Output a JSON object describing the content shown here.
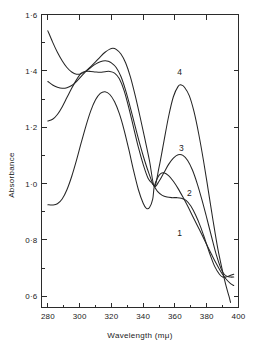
{
  "chart_data": {
    "type": "line",
    "title": "",
    "xlabel": "Wavelength (mμ)",
    "ylabel": "Absorbance",
    "xlim": [
      276,
      400
    ],
    "ylim": [
      0.56,
      1.6
    ],
    "grid": false,
    "legend_position": "inline-curve-labels",
    "xticks": [
      280,
      300,
      320,
      340,
      360,
      380,
      400
    ],
    "xtick_labels": [
      "280",
      "300",
      "320",
      "340",
      "360",
      "380",
      "400"
    ],
    "xminor_ticks": [
      290,
      310,
      330,
      350,
      370,
      390
    ],
    "yticks": [
      0.6,
      0.8,
      1.0,
      1.2,
      1.4,
      1.6
    ],
    "ytick_labels": [
      "0·6",
      "0·8",
      "1·0",
      "1·2",
      "1·4",
      "1·6"
    ],
    "yminor_ticks": [
      0.7,
      0.9,
      1.1,
      1.3,
      1.5
    ],
    "annotations": [
      {
        "text": "1",
        "x": 363,
        "y": 0.815
      },
      {
        "text": "2",
        "x": 369,
        "y": 0.955
      },
      {
        "text": "3",
        "x": 364,
        "y": 1.115
      },
      {
        "text": "4",
        "x": 363,
        "y": 1.385
      }
    ],
    "isosbestic_point": {
      "x": 347,
      "y": 0.99
    },
    "series": [
      {
        "name": "1",
        "label": "1",
        "points": [
          [
            280,
            0.925
          ],
          [
            283,
            0.924
          ],
          [
            286,
            0.928
          ],
          [
            289,
            0.945
          ],
          [
            292,
            0.978
          ],
          [
            295,
            1.025
          ],
          [
            298,
            1.082
          ],
          [
            301,
            1.145
          ],
          [
            304,
            1.205
          ],
          [
            307,
            1.258
          ],
          [
            310,
            1.297
          ],
          [
            313,
            1.32
          ],
          [
            316,
            1.326
          ],
          [
            319,
            1.316
          ],
          [
            322,
            1.29
          ],
          [
            325,
            1.248
          ],
          [
            328,
            1.19
          ],
          [
            331,
            1.12
          ],
          [
            334,
            1.045
          ],
          [
            337,
            0.978
          ],
          [
            340,
            0.93
          ],
          [
            342,
            0.912
          ],
          [
            344,
            0.915
          ],
          [
            346,
            0.945
          ],
          [
            347,
            0.99
          ],
          [
            349,
            1.02
          ],
          [
            351,
            1.035
          ],
          [
            353,
            1.038
          ],
          [
            356,
            1.028
          ],
          [
            359,
            1.008
          ],
          [
            362,
            0.982
          ],
          [
            365,
            0.952
          ],
          [
            368,
            0.92
          ],
          [
            371,
            0.886
          ],
          [
            374,
            0.852
          ],
          [
            377,
            0.818
          ],
          [
            380,
            0.783
          ],
          [
            383,
            0.749
          ],
          [
            386,
            0.716
          ],
          [
            389,
            0.686
          ],
          [
            392,
            0.662
          ],
          [
            395,
            0.645
          ],
          [
            397,
            0.638
          ]
        ]
      },
      {
        "name": "2",
        "label": "2",
        "points": [
          [
            280,
            1.222
          ],
          [
            283,
            1.228
          ],
          [
            286,
            1.245
          ],
          [
            289,
            1.272
          ],
          [
            292,
            1.305
          ],
          [
            295,
            1.338
          ],
          [
            298,
            1.368
          ],
          [
            301,
            1.392
          ],
          [
            304,
            1.398
          ],
          [
            307,
            1.398
          ],
          [
            310,
            1.396
          ],
          [
            313,
            1.395
          ],
          [
            316,
            1.397
          ],
          [
            319,
            1.398
          ],
          [
            322,
            1.392
          ],
          [
            325,
            1.372
          ],
          [
            328,
            1.33
          ],
          [
            331,
            1.268
          ],
          [
            334,
            1.198
          ],
          [
            337,
            1.128
          ],
          [
            340,
            1.068
          ],
          [
            343,
            1.02
          ],
          [
            346,
            0.998
          ],
          [
            347,
            0.99
          ],
          [
            349,
            0.972
          ],
          [
            352,
            0.958
          ],
          [
            355,
            0.952
          ],
          [
            358,
            0.95
          ],
          [
            361,
            0.95
          ],
          [
            364,
            0.948
          ],
          [
            367,
            0.94
          ],
          [
            370,
            0.92
          ],
          [
            373,
            0.888
          ],
          [
            376,
            0.848
          ],
          [
            379,
            0.8
          ],
          [
            382,
            0.75
          ],
          [
            385,
            0.706
          ],
          [
            388,
            0.678
          ],
          [
            390,
            0.668
          ],
          [
            392,
            0.668
          ],
          [
            394,
            0.672
          ],
          [
            396,
            0.676
          ],
          [
            397,
            0.678
          ]
        ]
      },
      {
        "name": "3",
        "label": "3",
        "points": [
          [
            280,
            1.362
          ],
          [
            283,
            1.35
          ],
          [
            286,
            1.342
          ],
          [
            289,
            1.338
          ],
          [
            292,
            1.34
          ],
          [
            295,
            1.348
          ],
          [
            298,
            1.362
          ],
          [
            301,
            1.38
          ],
          [
            304,
            1.398
          ],
          [
            307,
            1.412
          ],
          [
            310,
            1.424
          ],
          [
            313,
            1.432
          ],
          [
            316,
            1.436
          ],
          [
            318,
            1.434
          ],
          [
            320,
            1.428
          ],
          [
            323,
            1.412
          ],
          [
            326,
            1.38
          ],
          [
            329,
            1.33
          ],
          [
            332,
            1.268
          ],
          [
            335,
            1.202
          ],
          [
            338,
            1.138
          ],
          [
            341,
            1.08
          ],
          [
            344,
            1.03
          ],
          [
            347,
            0.99
          ],
          [
            350,
            1.008
          ],
          [
            353,
            1.038
          ],
          [
            356,
            1.068
          ],
          [
            359,
            1.09
          ],
          [
            362,
            1.102
          ],
          [
            365,
            1.1
          ],
          [
            368,
            1.082
          ],
          [
            371,
            1.048
          ],
          [
            374,
            1.0
          ],
          [
            377,
            0.942
          ],
          [
            380,
            0.878
          ],
          [
            383,
            0.812
          ],
          [
            386,
            0.748
          ],
          [
            389,
            0.698
          ],
          [
            391,
            0.678
          ],
          [
            393,
            0.67
          ],
          [
            395,
            0.668
          ],
          [
            397,
            0.668
          ]
        ]
      },
      {
        "name": "4",
        "label": "4",
        "points": [
          [
            280,
            1.542
          ],
          [
            283,
            1.502
          ],
          [
            286,
            1.466
          ],
          [
            289,
            1.436
          ],
          [
            292,
            1.412
          ],
          [
            295,
            1.396
          ],
          [
            298,
            1.388
          ],
          [
            301,
            1.39
          ],
          [
            304,
            1.4
          ],
          [
            307,
            1.415
          ],
          [
            310,
            1.432
          ],
          [
            313,
            1.45
          ],
          [
            316,
            1.466
          ],
          [
            319,
            1.477
          ],
          [
            321,
            1.48
          ],
          [
            323,
            1.476
          ],
          [
            326,
            1.46
          ],
          [
            329,
            1.428
          ],
          [
            332,
            1.378
          ],
          [
            335,
            1.312
          ],
          [
            338,
            1.238
          ],
          [
            341,
            1.16
          ],
          [
            344,
            1.08
          ],
          [
            347,
            0.99
          ],
          [
            350,
            1.058
          ],
          [
            353,
            1.148
          ],
          [
            356,
            1.238
          ],
          [
            359,
            1.308
          ],
          [
            362,
            1.345
          ],
          [
            364,
            1.35
          ],
          [
            366,
            1.342
          ],
          [
            369,
            1.312
          ],
          [
            372,
            1.255
          ],
          [
            375,
            1.175
          ],
          [
            378,
            1.08
          ],
          [
            381,
            0.975
          ],
          [
            384,
            0.868
          ],
          [
            387,
            0.768
          ],
          [
            390,
            0.688
          ],
          [
            392,
            0.64
          ],
          [
            394,
            0.6
          ],
          [
            395,
            0.578
          ]
        ]
      }
    ]
  }
}
